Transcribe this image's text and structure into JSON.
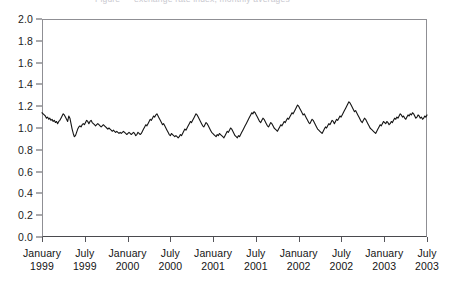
{
  "title_strip": {
    "text": "Figure — exchange rate index, monthly averages"
  },
  "chart_data": {
    "type": "line",
    "title": "",
    "subtitle": "",
    "xlabel": "",
    "ylabel": "",
    "ylim": [
      0.0,
      2.0
    ],
    "ytick_step": 0.2,
    "yticks": [
      "2.0",
      "1.8",
      "1.6",
      "1.4",
      "1.2",
      "1.0",
      "0.8",
      "0.6",
      "0.4",
      "0.2",
      "0.0"
    ],
    "grid": false,
    "legend": null,
    "legend_position": "none",
    "line_color": "#141414",
    "line_width": 1.1,
    "xlim": [
      "January 1999",
      "July 2003"
    ],
    "xtick_labels": [
      {
        "month": "January",
        "year": "1999"
      },
      {
        "month": "July",
        "year": "1999"
      },
      {
        "month": "January",
        "year": "2000"
      },
      {
        "month": "July",
        "year": "2000"
      },
      {
        "month": "January",
        "year": "2001"
      },
      {
        "month": "July",
        "year": "2001"
      },
      {
        "month": "January",
        "year": "2002"
      },
      {
        "month": "July",
        "year": "2002"
      },
      {
        "month": "January",
        "year": "2003"
      },
      {
        "month": "July",
        "year": "2003"
      }
    ],
    "x_unit": "weeks since January 1999",
    "x_points_per_xtick": 26,
    "series": [
      {
        "name": "rate",
        "values": [
          1.14,
          1.13,
          1.12,
          1.11,
          1.09,
          1.1,
          1.08,
          1.09,
          1.07,
          1.08,
          1.06,
          1.07,
          1.05,
          1.06,
          1.04,
          1.06,
          1.07,
          1.09,
          1.11,
          1.13,
          1.12,
          1.1,
          1.08,
          1.06,
          1.11,
          1.09,
          1.04,
          0.99,
          0.95,
          0.92,
          0.93,
          0.96,
          0.99,
          1.01,
          1.02,
          1.01,
          1.03,
          1.04,
          1.03,
          1.05,
          1.07,
          1.06,
          1.04,
          1.06,
          1.07,
          1.05,
          1.04,
          1.03,
          1.02,
          1.03,
          1.04,
          1.03,
          1.02,
          1.01,
          1.02,
          1.03,
          1.02,
          1.01,
          1.0,
          0.99,
          1.0,
          0.99,
          0.98,
          0.97,
          0.98,
          0.97,
          0.96,
          0.97,
          0.96,
          0.95,
          0.96,
          0.95,
          0.96,
          0.97,
          0.96,
          0.95,
          0.94,
          0.95,
          0.96,
          0.95,
          0.94,
          0.95,
          0.96,
          0.95,
          0.93,
          0.94,
          0.96,
          0.95,
          0.94,
          0.95,
          0.97,
          0.99,
          1.01,
          1.03,
          1.02,
          1.04,
          1.06,
          1.08,
          1.07,
          1.09,
          1.11,
          1.1,
          1.12,
          1.13,
          1.11,
          1.09,
          1.07,
          1.05,
          1.03,
          1.04,
          1.02,
          1.0,
          0.98,
          0.96,
          0.94,
          0.93,
          0.95,
          0.94,
          0.93,
          0.92,
          0.93,
          0.92,
          0.91,
          0.92,
          0.94,
          0.93,
          0.95,
          0.97,
          0.99,
          0.98,
          1.0,
          1.02,
          1.04,
          1.06,
          1.05,
          1.07,
          1.09,
          1.11,
          1.13,
          1.12,
          1.1,
          1.08,
          1.06,
          1.04,
          1.02,
          1.01,
          1.03,
          1.05,
          1.04,
          1.02,
          1.0,
          0.98,
          0.96,
          0.95,
          0.94,
          0.93,
          0.92,
          0.94,
          0.93,
          0.95,
          0.94,
          0.93,
          0.92,
          0.91,
          0.93,
          0.95,
          0.97,
          0.96,
          0.98,
          1.0,
          0.99,
          0.97,
          0.95,
          0.93,
          0.92,
          0.91,
          0.93,
          0.92,
          0.94,
          0.96,
          0.98,
          1.0,
          1.02,
          1.04,
          1.06,
          1.08,
          1.1,
          1.12,
          1.14,
          1.13,
          1.15,
          1.14,
          1.12,
          1.1,
          1.08,
          1.06,
          1.05,
          1.07,
          1.09,
          1.08,
          1.06,
          1.04,
          1.02,
          1.01,
          1.03,
          1.05,
          1.04,
          1.02,
          1.0,
          0.99,
          0.98,
          0.97,
          0.99,
          1.01,
          1.03,
          1.02,
          1.04,
          1.06,
          1.05,
          1.07,
          1.09,
          1.08,
          1.1,
          1.12,
          1.14,
          1.13,
          1.15,
          1.17,
          1.19,
          1.21,
          1.2,
          1.18,
          1.16,
          1.14,
          1.12,
          1.13,
          1.11,
          1.09,
          1.07,
          1.05,
          1.04,
          1.06,
          1.08,
          1.07,
          1.05,
          1.03,
          1.01,
          0.99,
          0.98,
          0.97,
          0.96,
          0.95,
          0.97,
          0.99,
          1.01,
          1.0,
          1.02,
          1.04,
          1.03,
          1.05,
          1.07,
          1.06,
          1.04,
          1.06,
          1.08,
          1.07,
          1.09,
          1.11,
          1.1,
          1.12,
          1.14,
          1.16,
          1.18,
          1.2,
          1.22,
          1.24,
          1.23,
          1.21,
          1.19,
          1.17,
          1.15,
          1.16,
          1.14,
          1.12,
          1.1,
          1.08,
          1.06,
          1.05,
          1.07,
          1.09,
          1.08,
          1.06,
          1.04,
          1.02,
          1.0,
          0.99,
          0.98,
          0.97,
          0.96,
          0.95,
          0.97,
          0.99,
          1.01,
          1.03,
          1.02,
          1.04,
          1.06,
          1.05,
          1.04,
          1.06,
          1.05,
          1.03,
          1.04,
          1.06,
          1.05,
          1.07,
          1.09,
          1.08,
          1.1,
          1.09,
          1.11,
          1.13,
          1.12,
          1.1,
          1.11,
          1.09,
          1.08,
          1.1,
          1.12,
          1.11,
          1.13,
          1.12,
          1.14,
          1.13,
          1.11,
          1.09,
          1.1,
          1.12,
          1.11,
          1.09,
          1.1,
          1.08,
          1.09,
          1.11,
          1.1,
          1.12
        ]
      }
    ],
    "y_min_observed": 0.91,
    "y_max_observed": 1.24,
    "n_points": 346
  }
}
